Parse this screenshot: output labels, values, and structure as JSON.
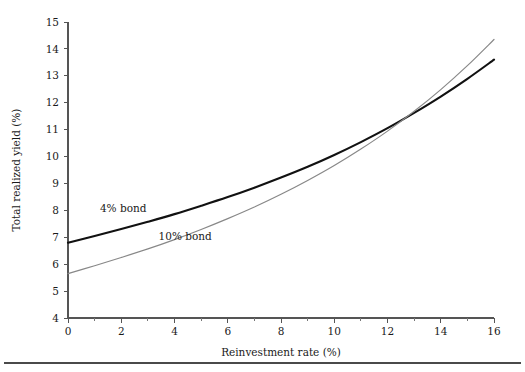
{
  "figure": {
    "background_color": "#ffffff",
    "footer_rule": true
  },
  "chart_data": {
    "type": "line",
    "title": "",
    "subtitle": "",
    "xlabel": "Reinvestment rate (%)",
    "ylabel": "Total realized yield (%)",
    "xlim": [
      0,
      16
    ],
    "ylim": [
      4,
      15
    ],
    "grid": false,
    "legend_position": "inline-annotations",
    "x_major_ticks": [
      0,
      2,
      4,
      6,
      8,
      10,
      12,
      14,
      16
    ],
    "x_minor_ticks": [
      1,
      3,
      5,
      7,
      9,
      11,
      13,
      15
    ],
    "x_tick_labels": [
      "0",
      "2",
      "4",
      "6",
      "8",
      "10",
      "12",
      "14",
      "16"
    ],
    "y_major_ticks": [
      4,
      5,
      6,
      7,
      8,
      9,
      10,
      11,
      12,
      13,
      14,
      15
    ],
    "y_tick_labels": [
      "4",
      "5",
      "6",
      "7",
      "8",
      "9",
      "10",
      "11",
      "12",
      "13",
      "14",
      "15"
    ],
    "x": [
      0,
      1,
      2,
      3,
      4,
      5,
      6,
      7,
      8,
      9,
      10,
      11,
      12,
      13,
      14,
      15,
      16
    ],
    "series": [
      {
        "name": "4% bond",
        "color": "#111111",
        "width": 2.1,
        "values": [
          6.8,
          6.99,
          7.19,
          7.4,
          7.62,
          7.86,
          8.11,
          8.38,
          8.67,
          8.98,
          9.32,
          9.69,
          10.09,
          10.53,
          11.0,
          11.51,
          12.06
        ],
        "annotation": {
          "label": "4% bond",
          "x": 1.2,
          "y": 7.95
        }
      },
      {
        "name": "10% bond",
        "color": "#888888",
        "width": 1.2,
        "values": [
          5.65,
          5.86,
          6.08,
          6.31,
          6.56,
          6.83,
          7.12,
          7.43,
          7.77,
          8.14,
          8.54,
          8.98,
          9.46,
          9.99,
          10.57,
          11.21,
          11.91
        ],
        "annotation": {
          "label": "10% bond",
          "x": 3.4,
          "y": 6.9
        }
      }
    ],
    "annotations": [
      {
        "text": "4% bond",
        "series": "4% bond"
      },
      {
        "text": "10% bond",
        "series": "10% bond"
      }
    ],
    "endpoints": {
      "4% bond": {
        "start": 6.8,
        "end": 13.6
      },
      "10% bond": {
        "start": 5.65,
        "end": 14.35
      }
    },
    "crossover": {
      "x": 10.3,
      "y": 10.4
    }
  }
}
